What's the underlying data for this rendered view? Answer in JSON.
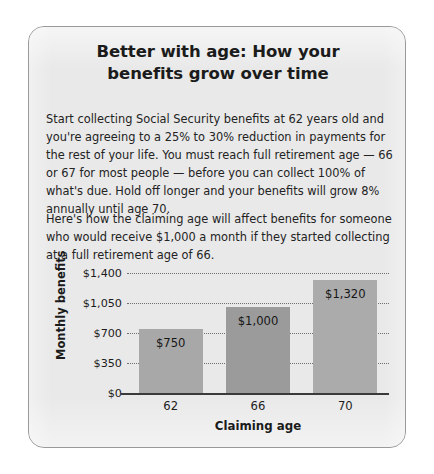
{
  "card": {
    "headline": {
      "line1": "Better with age: How your",
      "line2": "benefits grow over time"
    },
    "paragraphs": {
      "p1": "Start collecting Social Security benefits at 62 years old and you're agreeing to a 25% to 30% reduction in payments for the rest of your life. You must reach full retirement age — 66 or 67 for most people — before you can collect 100% of what's due. Hold off longer and your benefits will grow 8% annually until age 70.",
      "p2": "Here's how the claiming age will affect benefits for someone who would receive $1,000 a month if they started collecting at a full retirement age of 66."
    }
  },
  "chart_data": {
    "type": "bar",
    "title": "",
    "xlabel": "Claiming age",
    "ylabel": "Monthly benefits",
    "categories": [
      "62",
      "66",
      "70"
    ],
    "values": [
      750,
      1000,
      1320
    ],
    "value_labels": [
      "$750",
      "$1,000",
      "$1,320"
    ],
    "ylim": [
      0,
      1400
    ],
    "yticks": [
      0,
      350,
      700,
      1050,
      1400
    ],
    "ytick_labels": [
      "$0",
      "$350",
      "$700",
      "$1,050",
      "$1,400"
    ],
    "grid": "horizontal-dotted",
    "legend": "none",
    "bar_colors": [
      "#a8a8a8",
      "#9b9b9b",
      "#ababab"
    ]
  }
}
